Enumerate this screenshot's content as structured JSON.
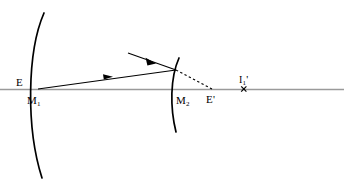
{
  "figure": {
    "type": "optics-ray-diagram",
    "width": 344,
    "height": 188,
    "background_color": "#ffffff",
    "stroke_color": "#000000",
    "axis_color": "#999999"
  },
  "labels": {
    "left_mirror_vertex": {
      "text": "E",
      "sub": "",
      "prime": ""
    },
    "left_mirror_name": {
      "text": "M",
      "sub": "1",
      "prime": ""
    },
    "right_mirror_name": {
      "text": "M",
      "sub": "2",
      "prime": ""
    },
    "right_vertex_image": {
      "text": "E",
      "sub": "",
      "prime": "'"
    },
    "image_point": {
      "text": "I",
      "sub": "1",
      "prime": "'"
    }
  },
  "markers": {
    "image_point_marker": "x-marker"
  },
  "elements": {
    "axis_label": "optical-axis",
    "mirror_1_label": "concave-mirror-m1",
    "mirror_2_label": "concave-mirror-m2",
    "ray_outgoing_label": "ray-m1-to-m2",
    "ray_incoming_label": "incoming-ray",
    "virtual_ray_label": "dashed-virtual-ray"
  },
  "geometry": {
    "axis_y": 89,
    "mirror1_vertex_x": 38,
    "mirror2_vertex_x": 172,
    "reflection_point": [
      176,
      70
    ],
    "image_e_prime_x": 212,
    "image_point_x": 244
  }
}
